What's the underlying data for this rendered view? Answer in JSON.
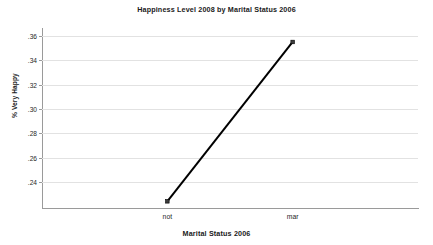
{
  "chart_data": {
    "type": "line",
    "title": "Happiness Level 2008 by Marital Status 2006",
    "xlabel": "Marital Status 2006",
    "ylabel": "% Very Happy",
    "categories": [
      "not",
      "mar"
    ],
    "values": [
      0.224,
      0.355
    ],
    "series": [
      {
        "name": "% Very Happy",
        "values": [
          0.224,
          0.355
        ]
      }
    ],
    "ytick_labels": [
      ".36",
      ".34",
      ".32",
      ".30",
      ".28",
      ".26",
      ".24"
    ],
    "ytick_values": [
      0.36,
      0.34,
      0.32,
      0.3,
      0.28,
      0.26,
      0.24
    ],
    "ylim": [
      0.2185,
      0.3665
    ],
    "xlim": [
      0,
      1
    ],
    "grid": true,
    "grid_axis": "y",
    "legend": "none",
    "line_color": "#000000",
    "marker_color": "#3c3c3c",
    "grid_color": "#e2e2e2",
    "axis_color": "#9a9a9a",
    "background": "#ffffff"
  }
}
